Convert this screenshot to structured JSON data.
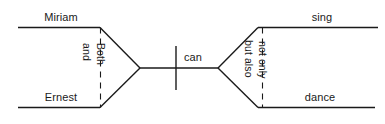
{
  "diagram": {
    "type": "reed-kellogg-sentence-diagram",
    "sentence": "Both Miriam and Ernest can not only sing but also dance.",
    "stroke_color": "#1a1a1a",
    "background_color": "#ffffff",
    "subjects": {
      "upper": "Miriam",
      "lower": "Ernest",
      "conjunction_left": "and",
      "conjunction_right": "Both"
    },
    "predicate": {
      "verb": "can",
      "upper": "sing",
      "lower": "dance",
      "conjunction_left": "but also",
      "conjunction_right": "not only"
    }
  }
}
